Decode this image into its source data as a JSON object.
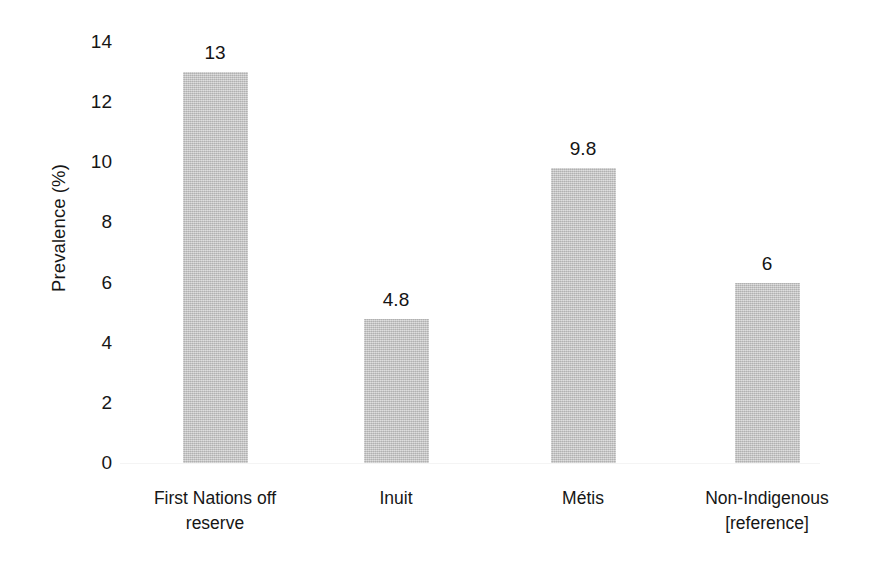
{
  "chart_data": {
    "type": "bar",
    "title": "",
    "subtitle": "",
    "xlabel": "",
    "ylabel": "Prevalence (%)",
    "categories": [
      "First Nations off\nreserve",
      "Inuit",
      "Métis",
      "Non-Indigenous\n[reference]"
    ],
    "values": [
      13,
      4.8,
      9.8,
      6
    ],
    "value_labels": [
      "13",
      "4.8",
      "9.8",
      "6"
    ],
    "ylim": [
      0,
      14
    ],
    "yticks": [
      0,
      2,
      4,
      6,
      8,
      10,
      12,
      14
    ],
    "ytick_labels": [
      "0",
      "2",
      "4",
      "6",
      "8",
      "10",
      "12",
      "14"
    ],
    "grid": false,
    "legend": false,
    "legend_position": "none",
    "bar_color": "#c3c3c3",
    "text_color": "#161616",
    "background_color": "#ffffff"
  },
  "figure": {
    "y_axis_title": "Prevalence (%)"
  }
}
